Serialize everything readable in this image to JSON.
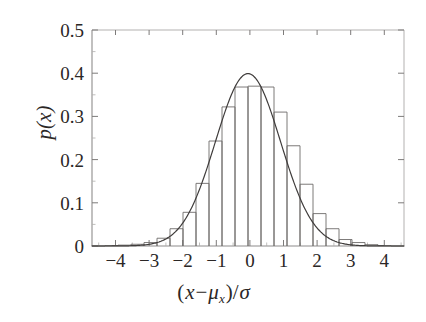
{
  "chart_data": {
    "type": "bar",
    "title": "",
    "subtitle": "",
    "xlabel": "(x − μ_x)/σ",
    "ylabel": "p(x)",
    "xlim": [
      -4.8,
      4.8
    ],
    "ylim": [
      0,
      0.5
    ],
    "xticks": [
      -4,
      -3,
      -2,
      -1,
      0,
      1,
      2,
      3,
      4
    ],
    "xtick_labels": [
      "−4",
      "−3",
      "−2",
      "−1",
      "0",
      "1",
      "2",
      "3",
      "4"
    ],
    "xminor_tick_step": 0.5,
    "yticks": [
      0,
      0.1,
      0.2,
      0.3,
      0.4,
      0.5
    ],
    "ytick_labels": [
      "0",
      "0.1",
      "0.2",
      "0.3",
      "0.4",
      "0.5"
    ],
    "yminor_tick_step": 0.05,
    "grid": false,
    "legend": null,
    "legend_position": "none",
    "frame": "box",
    "line_color": "#3f3c3b",
    "bar_edge_color": "#6e6b6a",
    "bar_fill_color": "#ffffff",
    "axis_color": "#a9a7a6",
    "text_color": "#2b2726",
    "bin_width": 0.4,
    "bin_edges": [
      -4.8,
      -4.4,
      -4.0,
      -3.6,
      -3.2,
      -2.8,
      -2.4,
      -2.0,
      -1.6,
      -1.2,
      -0.8,
      -0.4,
      0.0,
      0.4,
      0.8,
      1.2,
      1.6,
      2.0,
      2.4,
      2.8,
      3.2,
      3.6,
      4.0,
      4.4,
      4.8
    ],
    "bin_centers": [
      -4.6,
      -4.2,
      -3.8,
      -3.4,
      -3.0,
      -2.6,
      -2.2,
      -1.8,
      -1.4,
      -1.0,
      -0.6,
      -0.2,
      0.2,
      0.6,
      1.0,
      1.4,
      1.8,
      2.2,
      2.6,
      3.0,
      3.4,
      3.8,
      4.2,
      4.6
    ],
    "values": [
      0.0,
      0.001,
      0.002,
      0.004,
      0.008,
      0.018,
      0.04,
      0.078,
      0.145,
      0.243,
      0.322,
      0.368,
      0.37,
      0.368,
      0.31,
      0.232,
      0.143,
      0.075,
      0.04,
      0.015,
      0.008,
      0.003,
      0.001,
      0.0
    ],
    "series": [
      {
        "name": "histogram",
        "type": "bar",
        "values": [
          0.0,
          0.001,
          0.002,
          0.004,
          0.008,
          0.018,
          0.04,
          0.078,
          0.145,
          0.243,
          0.322,
          0.368,
          0.37,
          0.368,
          0.31,
          0.232,
          0.143,
          0.075,
          0.04,
          0.015,
          0.008,
          0.003,
          0.001,
          0.0
        ]
      },
      {
        "name": "gaussian-fit",
        "type": "line",
        "formula": "standard normal pdf",
        "peak_value": 0.399,
        "x": [
          -4.8,
          -4.4,
          -4.0,
          -3.6,
          -3.2,
          -2.8,
          -2.4,
          -2.0,
          -1.6,
          -1.2,
          -0.8,
          -0.4,
          0.0,
          0.4,
          0.8,
          1.2,
          1.6,
          2.0,
          2.4,
          2.8,
          3.2,
          3.6,
          4.0,
          4.4,
          4.8
        ],
        "y": [
          0.0,
          0.0,
          0.0,
          0.001,
          0.002,
          0.008,
          0.022,
          0.054,
          0.111,
          0.194,
          0.29,
          0.368,
          0.399,
          0.368,
          0.29,
          0.194,
          0.111,
          0.054,
          0.022,
          0.008,
          0.002,
          0.001,
          0.0,
          0.0,
          0.0
        ]
      }
    ]
  },
  "axes": {
    "y_title_main": "p",
    "y_title_arg": "(x)",
    "x_title_open": "(",
    "x_title_x": "x",
    "x_title_minus": "−",
    "x_title_mu": "μ",
    "x_title_mu_sub": "x",
    "x_title_close": ")/",
    "x_title_sigma": "σ"
  }
}
